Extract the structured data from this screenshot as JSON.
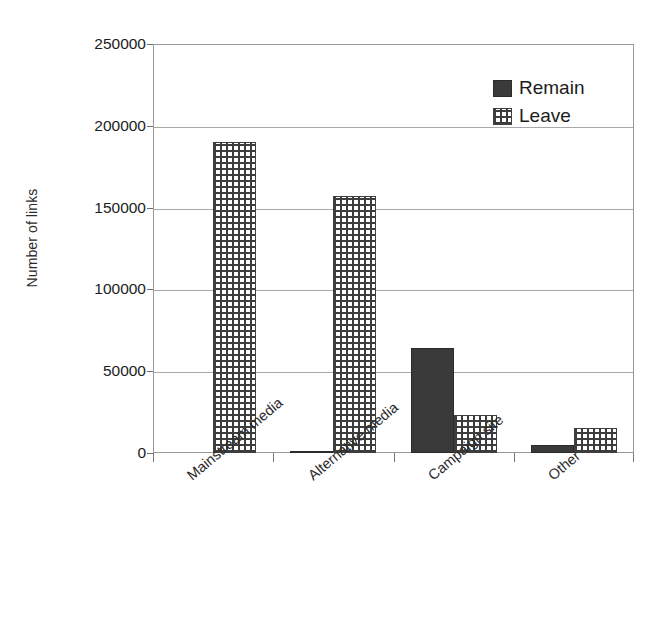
{
  "chart_data": {
    "type": "bar",
    "title": "",
    "xlabel": "",
    "ylabel": "Number of links",
    "categories": [
      "Mainstream media",
      "Alternative media",
      "Campaign site",
      "Other"
    ],
    "series": [
      {
        "name": "Remain",
        "color": "#3a3a3a",
        "pattern": "solid",
        "values": [
          0,
          1500,
          64000,
          5000
        ]
      },
      {
        "name": "Leave",
        "color": "#3d3d3d",
        "pattern": "cross-hatch",
        "values": [
          190000,
          157000,
          23000,
          15500
        ]
      }
    ],
    "ylim": [
      0,
      250000
    ],
    "yticks": [
      0,
      50000,
      100000,
      150000,
      200000,
      250000
    ],
    "yticklabels": [
      "0",
      "50000",
      "100000",
      "150000",
      "200000",
      "250000"
    ],
    "grid": true,
    "grid_axis": "y",
    "legend_position": "top-right",
    "legend": [
      "Remain",
      "Leave"
    ],
    "category_label_rotation": -40
  },
  "axis": {
    "y_title": "Number of links",
    "tick_labels": [
      "250000",
      "200000",
      "150000",
      "100000",
      "50000",
      "0"
    ]
  },
  "legend": {
    "items": [
      {
        "label": "Remain",
        "swatch": "solid-dark-square-icon"
      },
      {
        "label": "Leave",
        "swatch": "cross-hatch-square-icon"
      }
    ]
  },
  "categories": [
    {
      "label": "Mainstream media"
    },
    {
      "label": "Alternative media"
    },
    {
      "label": "Campaign site"
    },
    {
      "label": "Other"
    }
  ]
}
